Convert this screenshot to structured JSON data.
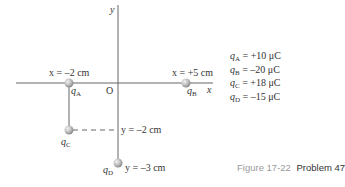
{
  "diagram": {
    "axes": {
      "x_label": "x",
      "y_label": "y",
      "origin_label": "O"
    },
    "charges": [
      {
        "id": "A",
        "name": "q",
        "sub": "A",
        "position_label": "x = –2 cm",
        "value": "= +10 μC",
        "x_cm": -2,
        "y_cm": 0
      },
      {
        "id": "B",
        "name": "q",
        "sub": "B",
        "position_label": "x = +5 cm",
        "value": "= –20 μC",
        "x_cm": 5,
        "y_cm": 0
      },
      {
        "id": "C",
        "name": "q",
        "sub": "C",
        "position_label": "y = –2 cm",
        "value": "= +18 μC",
        "x_cm": -2,
        "y_cm": -2
      },
      {
        "id": "D",
        "name": "q",
        "sub": "D",
        "position_label": "y = –3 cm",
        "value": "= –15 μC",
        "x_cm": 0,
        "y_cm": -3
      }
    ],
    "caption": {
      "figure": "Figure 17-22",
      "problem": "Problem 47"
    },
    "colors": {
      "axis": "#666666",
      "charge_fill": "#bdbdbd",
      "caption_figure": "#9a9a9a"
    }
  }
}
